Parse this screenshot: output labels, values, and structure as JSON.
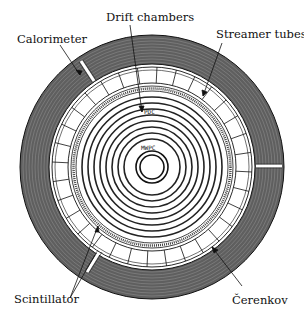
{
  "diagram": {
    "type": "detector-cross-section",
    "labels": {
      "calorimeter": "Calorimeter",
      "drift_chambers": "Drift chambers",
      "streamer_tubes": "Streamer tubes",
      "scintillator": "Scintillator",
      "cerenkov": "Čerenkov",
      "pdc": "PDC",
      "mwpc": "MWPC"
    },
    "colors": {
      "ink": "#1a1a1a",
      "background": "#ffffff",
      "calorimeter_fill": "#6e6e6e"
    }
  }
}
